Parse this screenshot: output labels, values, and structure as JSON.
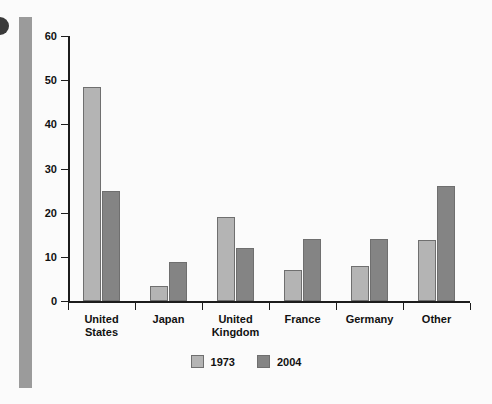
{
  "chart_data": {
    "type": "bar",
    "title": "",
    "subtitle": "",
    "xlabel": "",
    "ylabel": "",
    "ylim": [
      0,
      60
    ],
    "yticks": [
      0,
      10,
      20,
      30,
      40,
      50,
      60
    ],
    "grid": false,
    "legend_position": "bottom-center",
    "categories": [
      "United\nStates",
      "Japan",
      "United\nKingdom",
      "France",
      "Germany",
      "Other"
    ],
    "series": [
      {
        "name": "1973",
        "color": "#b4b4b4",
        "values": [
          48.5,
          3.5,
          19,
          7,
          8,
          13.8
        ]
      },
      {
        "name": "2004",
        "color": "#848484",
        "values": [
          25,
          8.8,
          12,
          14,
          14,
          26
        ]
      }
    ]
  },
  "legend": {
    "items": [
      {
        "label": "1973",
        "color": "#b4b4b4"
      },
      {
        "label": "2004",
        "color": "#848484"
      }
    ]
  },
  "decor": {
    "rule_color": "#9b9b9b",
    "bullet_color": "#3a3a3a"
  }
}
